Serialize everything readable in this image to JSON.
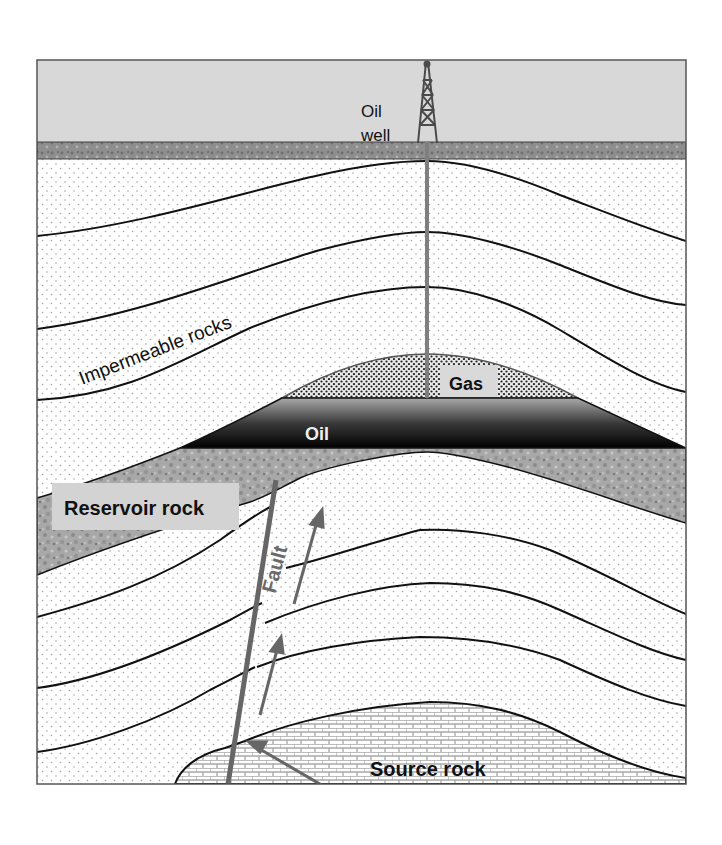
{
  "diagram": {
    "type": "geological cross-section",
    "labels": {
      "oil_well_line1": "Oil",
      "oil_well_line2": "well",
      "impermeable": "Impermeable rocks",
      "gas": "Gas",
      "oil": "Oil",
      "reservoir": "Reservoir rock",
      "fault": "Fault",
      "source": "Source rock"
    },
    "colors": {
      "sky": "#d9d9d9",
      "ground": "#8c8c8c",
      "dotted_bg": "#ffffff",
      "dot": "#9a9a9a",
      "layer_line": "#111111",
      "pipe": "#808080",
      "fault": "#666666",
      "oil_dark": "#000000",
      "oil_light": "#a6a6a6",
      "reservoir": "#a0a0a0",
      "label_box": "#d0d0d0",
      "brick": "#bfbfbf"
    }
  }
}
